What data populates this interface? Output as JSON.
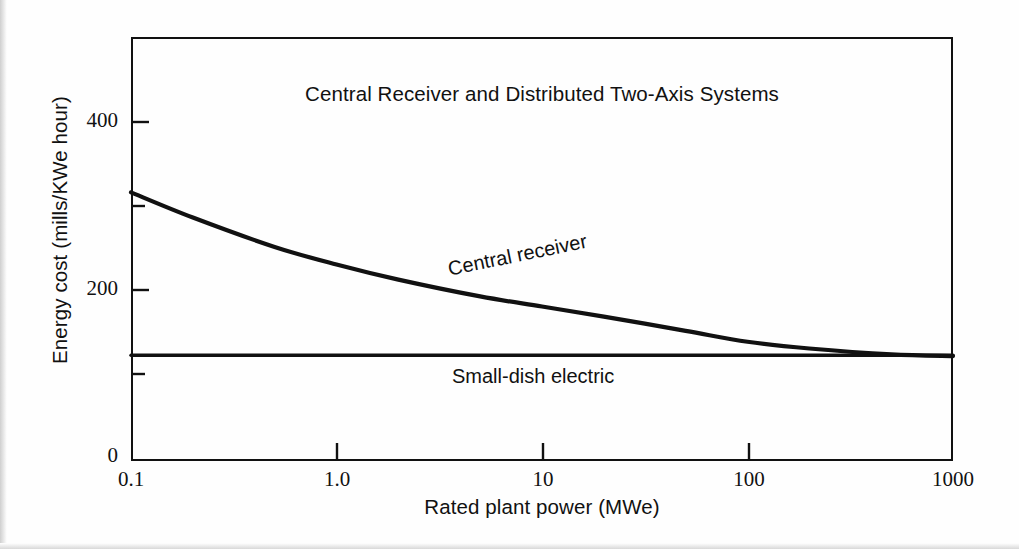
{
  "chart_data": {
    "type": "line",
    "title": "Central Receiver and Distributed Two-Axis Systems",
    "xlabel": "Rated plant power (MWe)",
    "ylabel": "Energy cost (mills/KWe hour)",
    "xscale": "log",
    "xlim": [
      0.1,
      1000
    ],
    "ylim": [
      0,
      505
    ],
    "grid": false,
    "legend": "inline-annotations",
    "xticks": [
      "0.1",
      "1.0",
      "10",
      "100",
      "1000"
    ],
    "xtick_values": [
      0.1,
      1.0,
      10,
      100,
      1000
    ],
    "yticks": [
      "0",
      "200",
      "400"
    ],
    "ytick_values": [
      0,
      200,
      400
    ],
    "yminor_tick_values": [
      100,
      300
    ],
    "series": [
      {
        "name": "Central receiver",
        "label": "Central receiver",
        "x": [
          0.1,
          0.2,
          0.5,
          1.0,
          2,
          5,
          10,
          20,
          50,
          100,
          200,
          500,
          1000
        ],
        "values": [
          320,
          290,
          255,
          234,
          216,
          196,
          184,
          172,
          155,
          142,
          134,
          127,
          125
        ]
      },
      {
        "name": "Small-dish electric",
        "label": "Small-dish electric",
        "x": [
          0.1,
          1000
        ],
        "values": [
          126,
          126
        ]
      }
    ]
  },
  "figure": {
    "title": "Central Receiver and Distributed Two-Axis Systems",
    "x_axis_title": "Rated plant power (MWe)",
    "y_axis_title": "Energy cost (mills/KWe hour)",
    "annotations": {
      "central_receiver": "Central receiver",
      "small_dish_electric": "Small-dish electric"
    },
    "x_tick_labels": [
      "0.1",
      "1.0",
      "10",
      "100",
      "1000"
    ],
    "y_tick_labels": [
      "0",
      "200",
      "400"
    ],
    "colors": {
      "line": "#111111",
      "axis": "#111111",
      "background": "#ffffff"
    }
  }
}
